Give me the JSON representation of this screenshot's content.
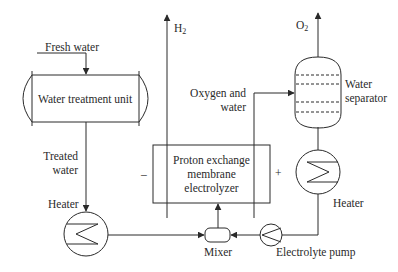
{
  "diagram": {
    "colors": {
      "line": "#2a2a2a",
      "background": "#ffffff"
    },
    "units": {
      "water_treatment": {
        "label": "Water treatment unit"
      },
      "heater_1": {
        "label": "Heater"
      },
      "electrolyzer": {
        "label_line1": "Proton exchange",
        "label_line2": "membrane",
        "label_line3": "electrolyzer",
        "minus": "–",
        "plus": "+"
      },
      "mixer": {
        "label": "Mixer"
      },
      "pump": {
        "label": "Electrolyte pump"
      },
      "heater_2": {
        "label": "Heater"
      },
      "separator": {
        "label_line1": "Water",
        "label_line2": "separator"
      }
    },
    "streams": {
      "fresh_water": "Fresh water",
      "treated_water_line1": "Treated",
      "treated_water_line2": "water",
      "h2_main": "H",
      "h2_sub": "2",
      "o2_main": "O",
      "o2_sub": "2",
      "oxygen_water_line1": "Oxygen and",
      "oxygen_water_line2": "water"
    }
  }
}
